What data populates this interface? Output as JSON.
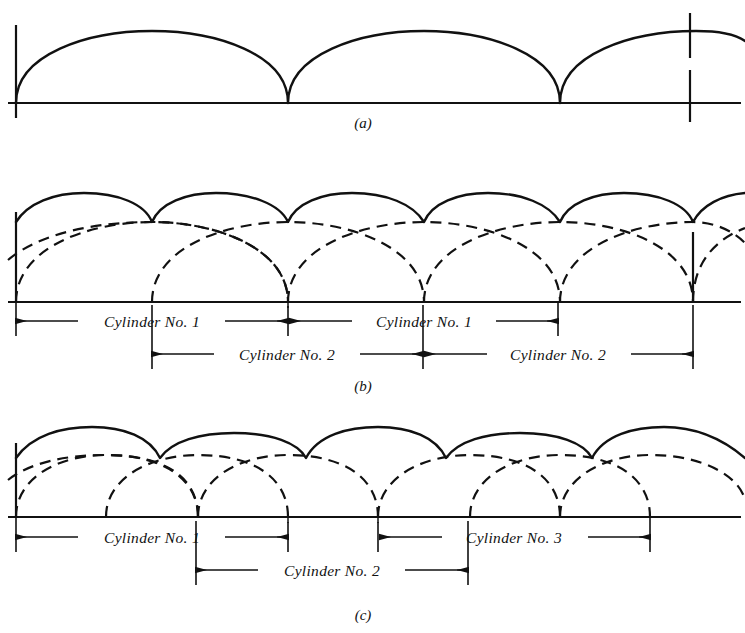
{
  "figure": {
    "background_color": "#ffffff",
    "ink_color": "#111111"
  },
  "panels": [
    {
      "id": "a",
      "label": "(a)",
      "label_x": 363,
      "label_y": 128,
      "baseline_y": 103,
      "baseline_x1": 8,
      "baseline_x2": 741,
      "description": "Single cylinder torque curve: successive half-sine humps",
      "arc_span": 272,
      "arc_height": 72,
      "arc_starts": [
        16,
        288,
        560
      ],
      "cusps": [
        288,
        560
      ],
      "ticks": [
        {
          "name": "left-tick",
          "x": 16,
          "y1": 25,
          "y2": 118,
          "style": "solid"
        },
        {
          "name": "right-tick",
          "x": 690,
          "y1": 13,
          "y2": 122,
          "style": "dashed-gap"
        }
      ]
    },
    {
      "id": "b",
      "label": "(b)",
      "label_x": 363,
      "label_y": 391,
      "baseline_y": 302,
      "baseline_x1": 8,
      "baseline_x2": 741,
      "description": "Two-cylinder engine, evenly spaced firing: dashed individual cylinder curves 136 deg apart, solid resultant torque",
      "arc_span": 272,
      "arc_height": 80,
      "resultant_height": 109,
      "dashed_family_1_starts": [
        16,
        288,
        560
      ],
      "dashed_family_2_starts": [
        -120,
        152,
        424,
        696
      ],
      "cusps": [
        152,
        288,
        424,
        560,
        693
      ],
      "ticks": [
        {
          "name": "left-tick",
          "x": 16,
          "y1": 212,
          "y2": 302,
          "style": "solid"
        },
        {
          "name": "right-tick",
          "x": 693,
          "y1": 232,
          "y2": 302,
          "style": "solid"
        }
      ]
    },
    {
      "id": "c",
      "label": "(c)",
      "label_x": 363,
      "label_y": 620,
      "baseline_y": 517,
      "baseline_x1": 8,
      "baseline_x2": 741,
      "description": "Three-cylinder engine, unevenly spaced firing: dashed individual cylinder curves, solid resultant torque with uneven humps",
      "arc_span": 272,
      "arc_height": 62,
      "resultant_height": 90,
      "dashed_family_1_starts": [
        16,
        288,
        560
      ],
      "dashed_family_2_starts": [
        -166,
        106,
        378,
        650
      ],
      "cusps": [
        106,
        288,
        378,
        560,
        650
      ],
      "ticks": [
        {
          "name": "left-tick",
          "x": 16,
          "y1": 443,
          "y2": 517,
          "style": "solid"
        }
      ]
    }
  ],
  "dimensions": {
    "panel_b": [
      {
        "label": "Cylinder No. 1",
        "x1": 16,
        "x2": 288,
        "y": 321,
        "row": 1
      },
      {
        "label": "Cylinder No. 1",
        "x1": 288,
        "x2": 558,
        "y": 321,
        "row": 1
      },
      {
        "label": "Cylinder No. 2",
        "x1": 152,
        "x2": 423,
        "y": 354,
        "row": 2
      },
      {
        "label": "Cylinder No. 2",
        "x1": 423,
        "x2": 693,
        "y": 354,
        "row": 2
      }
    ],
    "panel_c": [
      {
        "label": "Cylinder No. 1",
        "x1": 16,
        "x2": 288,
        "y": 537,
        "row": 1
      },
      {
        "label": "Cylinder No. 3",
        "x1": 378,
        "x2": 650,
        "y": 537,
        "row": 1
      },
      {
        "label": "Cylinder No. 2",
        "x1": 196,
        "x2": 468,
        "y": 570,
        "row": 2
      }
    ]
  },
  "labels": {
    "panel_a": "(a)",
    "panel_b": "(b)",
    "panel_c": "(c)",
    "cylinder_1": "Cylinder No. 1",
    "cylinder_2": "Cylinder No. 2",
    "cylinder_3": "Cylinder No. 3"
  }
}
